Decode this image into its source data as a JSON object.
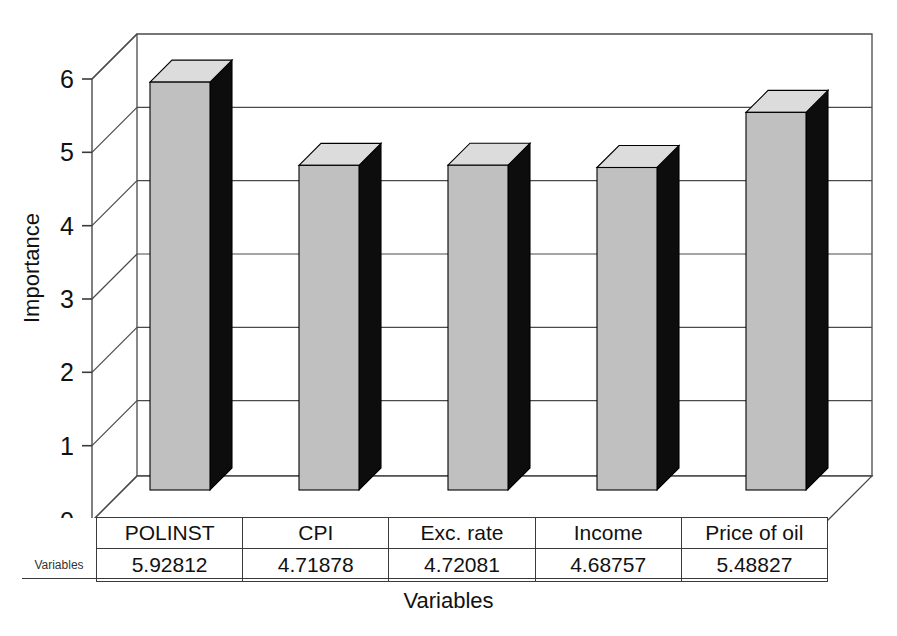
{
  "chart_data": {
    "type": "bar",
    "title": "",
    "subtitle": "",
    "xlabel": "Variables",
    "ylabel": "Importance",
    "categories": [
      "POLINST",
      "CPI",
      "Exc. rate",
      "Income",
      "Price of oil"
    ],
    "values": [
      5.92812,
      4.71878,
      4.72081,
      4.68757,
      5.48827
    ],
    "series": [
      {
        "name": "Variables",
        "values": [
          5.92812,
          4.71878,
          4.72081,
          4.68757,
          5.48827
        ]
      }
    ],
    "ylim": [
      0,
      6
    ],
    "yticks": [
      0,
      1,
      2,
      3,
      4,
      5,
      6
    ],
    "ytick_labels": [
      "0",
      "1",
      "2",
      "3",
      "4",
      "5",
      "6"
    ],
    "grid": true,
    "legend_position": "none",
    "style": "3d-column",
    "value_labels": [
      "5.92812",
      "4.71878",
      "4.72081",
      "4.68757",
      "5.48827"
    ]
  },
  "axes": {
    "y_title": "Importance",
    "x_title": "Variables",
    "y_ticks": [
      "6",
      "5",
      "4",
      "3",
      "2",
      "1",
      "0"
    ]
  },
  "table": {
    "legend_label": "Variables",
    "headers": [
      "POLINST",
      "CPI",
      "Exc. rate",
      "Income",
      "Price of oil"
    ],
    "values": [
      "5.92812",
      "4.71878",
      "4.72081",
      "4.68757",
      "5.48827"
    ]
  },
  "colors": {
    "bar_front": "#c0c0c0",
    "bar_top": "#dcdcdc",
    "bar_side": "#0d0d0d",
    "grid_line": "#4a4a4a",
    "axis_line": "#3a3a3a",
    "background": "#ffffff",
    "text": "#111111"
  }
}
